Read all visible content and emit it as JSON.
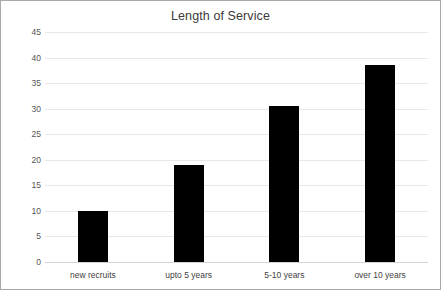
{
  "chart_data": {
    "type": "bar",
    "title": "Length of Service",
    "xlabel": "",
    "ylabel": "",
    "categories": [
      "new recruits",
      "upto 5 years",
      "5-10 years",
      "over 10 years"
    ],
    "values": [
      10,
      19,
      30.5,
      38.5
    ],
    "ylim": [
      0,
      45
    ],
    "ytick_step": 5,
    "yticks": [
      0,
      5,
      10,
      15,
      20,
      25,
      30,
      35,
      40,
      45
    ],
    "ytick_labels": [
      "0",
      "5",
      "10",
      "15",
      "20",
      "25",
      "30",
      "35",
      "40",
      "45"
    ],
    "grid": true,
    "legend": false,
    "legend_position": "none",
    "series": [
      {
        "name": "Length of Service",
        "values": [
          10,
          19,
          30.5,
          38.5
        ],
        "color": "#000000"
      }
    ]
  },
  "style": {
    "bar_color": "#000000",
    "gridline_color": "#e8e8e8",
    "axis_color": "#d3d3d3",
    "border_color": "#a9a9a9",
    "title_color": "#3a3a3a",
    "tick_color": "#555555",
    "background": "#ffffff"
  }
}
